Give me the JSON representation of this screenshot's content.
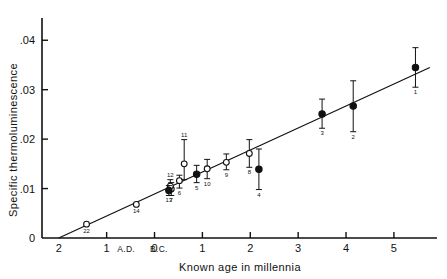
{
  "chart_data": {
    "type": "scatter",
    "title": "",
    "xlabel": "Known age in millennia",
    "ylabel": "Specific thermoluminescence",
    "grid": false,
    "legend": null,
    "xlim": [
      -2.35,
      5.9
    ],
    "ylim": [
      0,
      0.0445
    ],
    "xticks": [
      -2,
      -1,
      0,
      1,
      2,
      3,
      4,
      5
    ],
    "xticklabels": [
      "2",
      "1",
      "0",
      "1",
      "2",
      "3",
      "4",
      "5"
    ],
    "yticks": [
      0,
      0.01,
      0.02,
      0.03,
      0.04
    ],
    "yticklabels": [
      "0",
      ".01",
      ".02",
      ".03",
      ".04"
    ],
    "era_labels": {
      "left": "A.D.",
      "right": "B.C."
    },
    "fit_line": {
      "x0": -2.0,
      "y0": 0.0,
      "x1": 5.75,
      "y1": 0.0345
    },
    "marker_types": {
      "filled": "solid circle",
      "open": "open circle"
    },
    "points": [
      {
        "id": "1",
        "x": 5.45,
        "y": 0.0345,
        "yerr_low": 0.0305,
        "yerr_high": 0.0385,
        "marker": "filled",
        "label_pos": "below"
      },
      {
        "id": "2",
        "x": 4.15,
        "y": 0.0267,
        "yerr_low": 0.0215,
        "yerr_high": 0.0318,
        "marker": "filled",
        "label_pos": "below"
      },
      {
        "id": "3",
        "x": 3.5,
        "y": 0.0251,
        "yerr_low": 0.0222,
        "yerr_high": 0.0281,
        "marker": "filled",
        "label_pos": "below"
      },
      {
        "id": "4",
        "x": 2.18,
        "y": 0.0139,
        "yerr_low": 0.0098,
        "yerr_high": 0.018,
        "marker": "filled",
        "label_pos": "below"
      },
      {
        "id": "5",
        "x": 0.88,
        "y": 0.0129,
        "yerr_low": 0.0112,
        "yerr_high": 0.0147,
        "marker": "filled",
        "label_pos": "below"
      },
      {
        "id": "6",
        "x": 0.52,
        "y": 0.0116,
        "yerr_low": 0.0101,
        "yerr_high": 0.0127,
        "marker": "open",
        "label_pos": "below"
      },
      {
        "id": "7",
        "x": 0.35,
        "y": 0.0099,
        "yerr_low": 0.0086,
        "yerr_high": 0.0112,
        "marker": "open",
        "label_pos": "below"
      },
      {
        "id": "8",
        "x": 1.98,
        "y": 0.0171,
        "yerr_low": 0.0143,
        "yerr_high": 0.0199,
        "marker": "open",
        "label_pos": "below"
      },
      {
        "id": "9",
        "x": 1.5,
        "y": 0.0153,
        "yerr_low": 0.0138,
        "yerr_high": 0.017,
        "marker": "open",
        "label_pos": "below"
      },
      {
        "id": "10",
        "x": 1.1,
        "y": 0.014,
        "yerr_low": 0.012,
        "yerr_high": 0.0159,
        "marker": "open",
        "label_pos": "below"
      },
      {
        "id": "11",
        "x": 0.62,
        "y": 0.015,
        "yerr_low": 0.0118,
        "yerr_high": 0.0199,
        "marker": "open",
        "label_pos": "above"
      },
      {
        "id": "12",
        "x": 0.33,
        "y": 0.0105,
        "yerr_low": 0.0094,
        "yerr_high": 0.0118,
        "marker": "open",
        "label_pos": "above"
      },
      {
        "id": "13",
        "x": 0.3,
        "y": 0.0096,
        "yerr_low": 0.0086,
        "yerr_high": 0.0106,
        "marker": "filled",
        "label_pos": "below"
      },
      {
        "id": "14",
        "x": -0.38,
        "y": 0.0068,
        "yerr_low": 0.0068,
        "yerr_high": 0.0068,
        "marker": "open",
        "label_pos": "below"
      },
      {
        "id": "22",
        "x": -1.42,
        "y": 0.0028,
        "yerr_low": 0.0028,
        "yerr_high": 0.0028,
        "marker": "open",
        "label_pos": "below"
      }
    ]
  }
}
